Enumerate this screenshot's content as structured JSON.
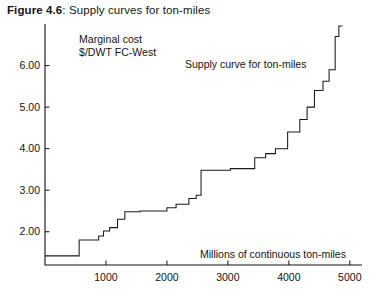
{
  "caption": {
    "label": "Figure 4.6",
    "rest": ": Supply curves for ton-miles"
  },
  "annotations": {
    "y_axis_title_line1": "Marginal cost",
    "y_axis_title_line2": "$/DWT FC-West",
    "curve_label": "Supply curve for ton-miles",
    "x_axis_title": "Millions of continuous ton-miles"
  },
  "chart_data": {
    "type": "line",
    "title": "Supply curves for ton-miles",
    "xlabel": "Millions of continuous ton-miles",
    "ylabel": "Marginal cost $/DWT FC-West",
    "xlim": [
      0,
      5200
    ],
    "ylim": [
      1.2,
      7.0
    ],
    "xticks": [
      1000,
      2000,
      3000,
      4000,
      5000
    ],
    "xtick_labels": [
      "1000",
      "2000",
      "3000",
      "4000",
      "5000"
    ],
    "yticks": [
      2.0,
      3.0,
      4.0,
      5.0,
      6.0
    ],
    "ytick_labels": [
      "2.00",
      "3.00",
      "4.00",
      "5.00",
      "6.00"
    ],
    "grid": false,
    "legend": false,
    "step_style": "post",
    "series": [
      {
        "name": "Supply curve for ton-miles",
        "x": [
          0,
          560,
          560,
          880,
          880,
          960,
          960,
          1060,
          1060,
          1190,
          1190,
          1310,
          1310,
          1560,
          1560,
          2000,
          2000,
          2150,
          2150,
          2360,
          2360,
          2480,
          2480,
          2560,
          2560,
          3040,
          3040,
          3440,
          3440,
          3620,
          3620,
          3780,
          3780,
          3980,
          3980,
          4180,
          4180,
          4300,
          4300,
          4420,
          4420,
          4560,
          4560,
          4660,
          4660,
          4760,
          4760,
          4820,
          4820,
          4880
        ],
        "y": [
          1.42,
          1.42,
          1.8,
          1.8,
          1.9,
          1.9,
          2.02,
          2.02,
          2.1,
          2.1,
          2.3,
          2.3,
          2.48,
          2.48,
          2.5,
          2.5,
          2.58,
          2.58,
          2.66,
          2.66,
          2.8,
          2.8,
          2.88,
          2.88,
          3.48,
          3.48,
          3.52,
          3.52,
          3.78,
          3.78,
          3.88,
          3.88,
          4.0,
          4.0,
          4.4,
          4.4,
          4.7,
          4.7,
          5.0,
          5.0,
          5.4,
          5.4,
          5.62,
          5.62,
          5.9,
          5.9,
          6.7,
          6.7,
          6.95,
          6.95
        ]
      }
    ]
  }
}
